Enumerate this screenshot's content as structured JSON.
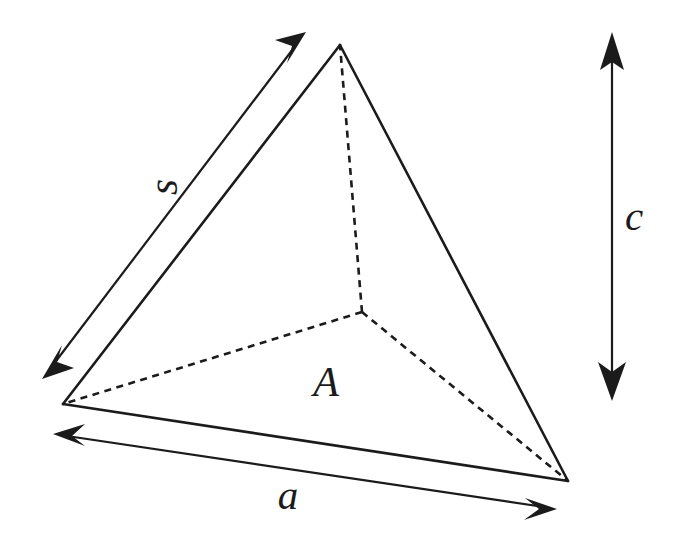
{
  "figure": {
    "kind": "tetrahedron-dimension-diagram",
    "background_color": "#ffffff",
    "ink_color": "#1b1b1b",
    "width": 674,
    "height": 538,
    "labels": {
      "slant_edge": "s",
      "base_edge": "a",
      "base_area": "A",
      "height": "c"
    },
    "vertices": {
      "apex": {
        "name": "apex",
        "x": 340,
        "y": 45
      },
      "front_left": {
        "name": "front-left",
        "x": 63,
        "y": 404
      },
      "front_right": {
        "name": "front-right",
        "x": 568,
        "y": 481
      },
      "hidden_back": {
        "name": "hidden-back",
        "x": 362,
        "y": 312
      }
    },
    "solid_edges": [
      {
        "name": "edge-left-to-apex",
        "from": "front_left",
        "to": "apex"
      },
      {
        "name": "edge-apex-to-right",
        "from": "apex",
        "to": "front_right"
      },
      {
        "name": "edge-left-to-right",
        "from": "front_left",
        "to": "front_right"
      }
    ],
    "hidden_edges": [
      {
        "name": "hidden-edge-back-to-apex",
        "from": "hidden_back",
        "to": "apex"
      },
      {
        "name": "hidden-edge-back-to-left",
        "from": "hidden_back",
        "to": "front_left"
      },
      {
        "name": "hidden-edge-back-to-right",
        "from": "hidden_back",
        "to": "front_right"
      }
    ],
    "dimension_arrows": [
      {
        "name": "slant-edge-dimension",
        "label": "s",
        "style": "double-headed",
        "from": {
          "x": 42,
          "y": 379
        },
        "to": {
          "x": 306,
          "y": 32
        }
      },
      {
        "name": "base-edge-dimension",
        "label": "a",
        "style": "double-headed",
        "from": {
          "x": 53,
          "y": 434
        },
        "to": {
          "x": 557,
          "y": 509
        }
      },
      {
        "name": "height-dimension",
        "label": "c",
        "style": "double-headed",
        "from": {
          "x": 612,
          "y": 32
        },
        "to": {
          "x": 612,
          "y": 401
        }
      }
    ]
  }
}
